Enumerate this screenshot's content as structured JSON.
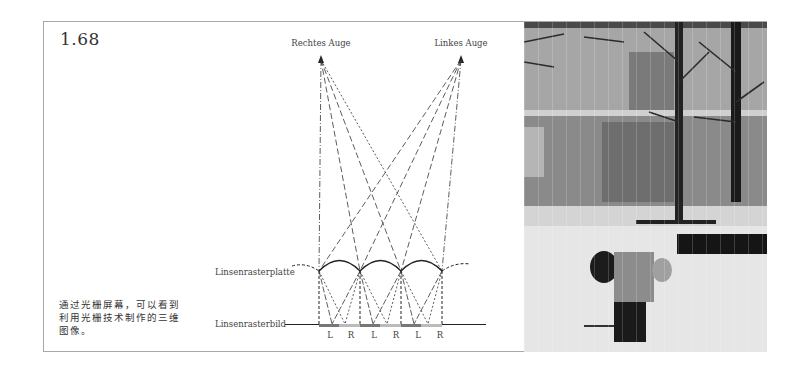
{
  "figure": {
    "number": "1.68",
    "caption": "通过光栅屏幕，可以看到利用光栅技术制作的三维图像。"
  },
  "diagram": {
    "eye_right_label": "Rechtes Auge",
    "eye_left_label": "Linkes Auge",
    "lens_plate_label": "Linsenrasterplatte",
    "lens_image_label": "Linsenrasterbild",
    "strip_labels": [
      "L",
      "R",
      "L",
      "R",
      "L",
      "R"
    ],
    "colors": {
      "line": "#222222",
      "strip_left": "#777777",
      "strip_right": "#bbbbbb"
    }
  },
  "photo": {
    "description": "lenticular 3D photo of a person in a snowy plaza in front of a building with bare trees"
  }
}
